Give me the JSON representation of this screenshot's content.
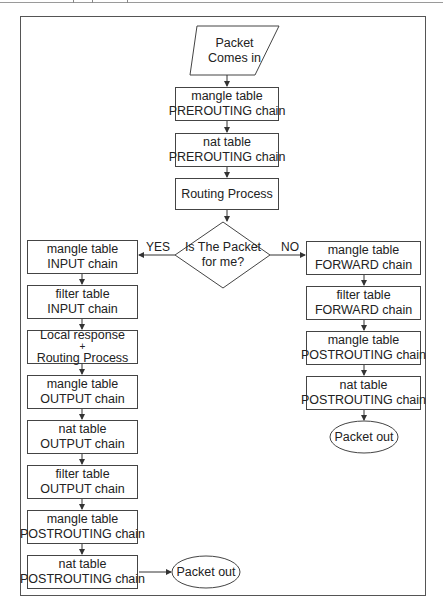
{
  "diagram": {
    "start": {
      "line1": "Packet",
      "line2": "Comes in"
    },
    "center": [
      {
        "line1": "mangle table",
        "line2": "PREROUTING chain"
      },
      {
        "line1": "nat table",
        "line2": "PREROUTING chain"
      },
      {
        "line1": "Routing Process",
        "line2": ""
      }
    ],
    "decision": {
      "line1": "Is The Packet",
      "line2": "for me?"
    },
    "yes_label": "YES",
    "no_label": "NO",
    "left": [
      {
        "line1": "mangle table",
        "line2": "INPUT chain"
      },
      {
        "line1": "filter table",
        "line2": "INPUT chain"
      },
      {
        "line1": "Local response",
        "plus": "+",
        "line2": "Routing Process"
      },
      {
        "line1": "mangle table",
        "line2": "OUTPUT chain"
      },
      {
        "line1": "nat table",
        "line2": "OUTPUT chain"
      },
      {
        "line1": "filter table",
        "line2": "OUTPUT chain"
      },
      {
        "line1": "mangle table",
        "line2": "POSTROUTING chain"
      },
      {
        "line1": "nat table",
        "line2": "POSTROUTING chain"
      }
    ],
    "right": [
      {
        "line1": "mangle table",
        "line2": "FORWARD chain"
      },
      {
        "line1": "filter table",
        "line2": "FORWARD chain"
      },
      {
        "line1": "mangle table",
        "line2": "POSTROUTING chain"
      },
      {
        "line1": "nat table",
        "line2": "POSTROUTING chain"
      }
    ],
    "end_left": "Packet out",
    "end_right": "Packet out"
  }
}
